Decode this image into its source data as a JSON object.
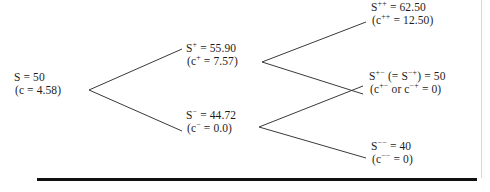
{
  "figure": {
    "type": "binomial-tree",
    "line_color": "#3a3a3a",
    "text_color": "#1d1d1d",
    "rule_color": "#101010"
  },
  "nodes": {
    "root": {
      "id": "root",
      "price_label": "S = 50",
      "option_label": "(c = 4.58)",
      "price_value": 50,
      "option_value": 4.58,
      "step": 0,
      "x": 88,
      "y": 90
    },
    "up": {
      "id": "up",
      "price_prefix": "S",
      "price_sup": "+",
      "price_rest": " = 55.90",
      "option_prefix": "(c",
      "option_sup": "+",
      "option_rest": " = 7.57)",
      "price_value": 55.9,
      "option_value": 7.57,
      "step": 1,
      "x": 260,
      "y": 62
    },
    "down": {
      "id": "down",
      "price_prefix": "S",
      "price_sup": "−",
      "price_rest": " = 44.72",
      "option_prefix": "(c",
      "option_sup": "−",
      "option_rest": " = 0.0)",
      "price_value": 44.72,
      "option_value": 0.0,
      "step": 1,
      "x": 258,
      "y": 127
    },
    "upup": {
      "id": "upup",
      "price_prefix": "S",
      "price_sup": "++",
      "price_rest": " = 62.50",
      "option_prefix": "(c",
      "option_sup": "++",
      "option_rest": " = 12.50)",
      "price_value": 62.5,
      "option_value": 12.5,
      "step": 2,
      "x": 371,
      "y": 20
    },
    "updown": {
      "id": "updown",
      "price_prefix": "S",
      "price_sup": "+−",
      "price_mid": " (= S",
      "price_sup2": "−+",
      "price_rest": ") = 50",
      "option_prefix": "(c",
      "option_sup": "+−",
      "option_mid": " or c",
      "option_sup2": "−+",
      "option_rest": " = 0)",
      "price_value": 50,
      "option_value": 0,
      "step": 2,
      "x": 369,
      "y": 90
    },
    "downdown": {
      "id": "downdown",
      "price_prefix": "S",
      "price_sup": "−−",
      "price_rest": " = 40",
      "option_prefix": "(c",
      "option_sup": "−−",
      "option_rest": " = 0)",
      "price_value": 40,
      "option_value": 0,
      "step": 2,
      "x": 371,
      "y": 157
    }
  },
  "edges": [
    {
      "name": "root-to-up",
      "from": "root",
      "to": "up",
      "x1": 89,
      "y1": 90,
      "x2": 182,
      "y2": 49
    },
    {
      "name": "root-to-down",
      "from": "root",
      "to": "down",
      "x1": 89,
      "y1": 90,
      "x2": 182,
      "y2": 131
    },
    {
      "name": "up-to-upup",
      "from": "up",
      "to": "upup",
      "x1": 262,
      "y1": 62,
      "x2": 366,
      "y2": 22
    },
    {
      "name": "up-to-updown",
      "from": "up",
      "to": "updown",
      "x1": 262,
      "y1": 62,
      "x2": 363,
      "y2": 94
    },
    {
      "name": "down-to-updown",
      "from": "down",
      "to": "updown",
      "x1": 259,
      "y1": 127,
      "x2": 363,
      "y2": 86
    },
    {
      "name": "down-to-downdown",
      "from": "down",
      "to": "downdown",
      "x1": 259,
      "y1": 127,
      "x2": 366,
      "y2": 158
    }
  ]
}
